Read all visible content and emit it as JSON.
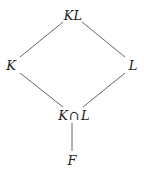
{
  "diagram": {
    "type": "lattice",
    "nodes": [
      {
        "id": "KL",
        "label": "KL",
        "x": 73,
        "y": 15
      },
      {
        "id": "K",
        "label": "K",
        "x": 11,
        "y": 65
      },
      {
        "id": "L",
        "label": "L",
        "x": 133,
        "y": 65
      },
      {
        "id": "KcapL",
        "label_left": "K",
        "label_op": "∩",
        "label_right": "L",
        "x": 74,
        "y": 115
      },
      {
        "id": "F",
        "label": "F",
        "x": 72,
        "y": 160
      }
    ],
    "edges": [
      {
        "from": "KL",
        "to": "K"
      },
      {
        "from": "KL",
        "to": "L"
      },
      {
        "from": "K",
        "to": "KcapL"
      },
      {
        "from": "L",
        "to": "KcapL"
      },
      {
        "from": "KcapL",
        "to": "F"
      }
    ],
    "colors": {
      "line": "#555555",
      "text": "#222222",
      "background": "#ffffff"
    }
  }
}
